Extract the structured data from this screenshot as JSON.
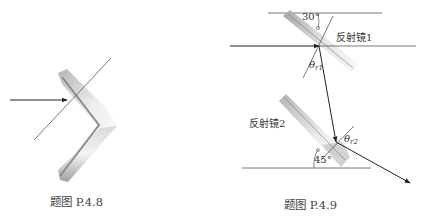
{
  "figures": [
    {
      "id": "p48",
      "caption": "题图 P.4.8",
      "description": "V-shaped corner mirror with incoming horizontal ray and normal line"
    },
    {
      "id": "p49",
      "caption": "题图 P.4.9",
      "mirror1_label": "反射镜1",
      "mirror2_label": "反射镜2",
      "angle_top": "30°",
      "angle_bottom": "45°",
      "theta_r1": {
        "symbol": "θ",
        "sub": "r1"
      },
      "theta_r2": {
        "symbol": "θ",
        "sub": "r2"
      }
    }
  ],
  "colors": {
    "line": "#3a3a3a",
    "mirror_dark": "#9a9a9a",
    "mirror_light": "#f2f2f2",
    "text": "#333333"
  }
}
